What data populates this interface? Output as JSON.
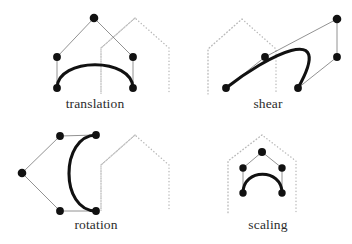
{
  "figure": {
    "background_color": "#ffffff",
    "width": 352,
    "height": 244,
    "curve_color": "#111111",
    "control_polygon_color": "#6e6e6e",
    "control_point_color": "#111111",
    "ghost_outline_color": "#b9b9b9",
    "label_color": "#2b2b2b"
  },
  "panels": [
    {
      "id": "translation",
      "label": "translation",
      "label_x": 95,
      "label_y": 108,
      "ghost_outline_points": "135,18 101,48 101,94 101,48 135,18 169,48 169,94",
      "curve": {
        "type": "cubic-bezier",
        "start": [
          57,
          88
        ],
        "control1": [
          57,
          57
        ],
        "control2": [
          133,
          57
        ],
        "end": [
          133,
          88
        ]
      },
      "control_polygon": "57,88 57,57 94,18 133,57 133,88",
      "control_points": [
        {
          "name": "start-anchor",
          "x": 57,
          "y": 88,
          "r": 3.9
        },
        {
          "name": "control-point-1",
          "x": 57,
          "y": 57,
          "r": 3.9
        },
        {
          "name": "apex-point",
          "x": 94,
          "y": 18,
          "r": 4.3
        },
        {
          "name": "control-point-2",
          "x": 133,
          "y": 57,
          "r": 3.9
        },
        {
          "name": "end-anchor",
          "x": 133,
          "y": 88,
          "r": 3.9
        }
      ]
    },
    {
      "id": "shear",
      "label": "shear",
      "label_x": 268,
      "label_y": 108,
      "ghost_outline_points": "242,19 208,49 208,94 208,49 242,19 276,49 276,94",
      "curve": {
        "type": "cubic-bezier",
        "start": [
          226,
          88
        ],
        "control1": [
          265,
          57
        ],
        "control2": [
          337,
          19
        ],
        "end": [
          298,
          88
        ]
      },
      "control_polygon": "226,88 265,57 337,19 337,57 298,88",
      "control_points": [
        {
          "name": "start-anchor",
          "x": 226,
          "y": 88,
          "r": 3.9
        },
        {
          "name": "control-point-1",
          "x": 265,
          "y": 57,
          "r": 3.9
        },
        {
          "name": "apex-point",
          "x": 337,
          "y": 19,
          "r": 4.3
        },
        {
          "name": "control-point-2",
          "x": 337,
          "y": 57,
          "r": 3.9
        },
        {
          "name": "end-anchor",
          "x": 298,
          "y": 88,
          "r": 3.9
        }
      ]
    },
    {
      "id": "rotation",
      "label": "rotation",
      "label_x": 96,
      "label_y": 229,
      "ghost_outline_points": "135,135 101,165 101,211 101,165 135,135 169,165 169,211",
      "curve": {
        "type": "cubic-bezier",
        "start": [
          96,
          135
        ],
        "control1": [
          60,
          136
        ],
        "control2": [
          60,
          211
        ],
        "end": [
          96,
          211
        ]
      },
      "control_polygon": "96,135 60,136 22,173 60,211 96,211",
      "control_points": [
        {
          "name": "start-anchor",
          "x": 96,
          "y": 135,
          "r": 3.9
        },
        {
          "name": "control-point-1",
          "x": 60,
          "y": 136,
          "r": 3.9
        },
        {
          "name": "apex-point",
          "x": 22,
          "y": 173,
          "r": 4.3
        },
        {
          "name": "control-point-2",
          "x": 60,
          "y": 211,
          "r": 3.9
        },
        {
          "name": "end-anchor",
          "x": 96,
          "y": 211,
          "r": 3.9
        }
      ]
    },
    {
      "id": "scaling",
      "label": "scaling",
      "label_x": 268,
      "label_y": 229,
      "ghost_outline_points": "262,135 228,161 228,214 228,161 262,135 296,161 296,214",
      "curve": {
        "type": "cubic-bezier",
        "start": [
          243,
          193
        ],
        "control1": [
          243,
          168
        ],
        "control2": [
          282,
          168
        ],
        "end": [
          282,
          193
        ]
      },
      "control_polygon": "243,193 243,168 262,152 282,168 282,193",
      "control_points": [
        {
          "name": "start-anchor",
          "x": 243,
          "y": 193,
          "r": 3.7
        },
        {
          "name": "control-point-1",
          "x": 243,
          "y": 168,
          "r": 3.7
        },
        {
          "name": "apex-point",
          "x": 262,
          "y": 152,
          "r": 4.0
        },
        {
          "name": "control-point-2",
          "x": 282,
          "y": 168,
          "r": 3.7
        },
        {
          "name": "end-anchor",
          "x": 282,
          "y": 193,
          "r": 3.7
        }
      ]
    }
  ]
}
